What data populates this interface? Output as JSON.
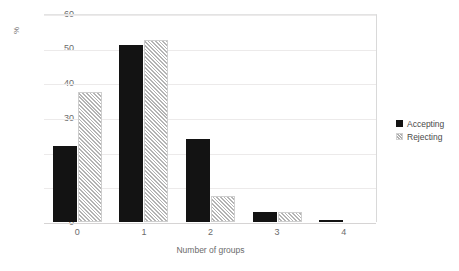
{
  "chart_data": {
    "type": "bar",
    "title": "",
    "xlabel": "Number of groups",
    "ylabel": "%",
    "categories": [
      "0",
      "1",
      "2",
      "3",
      "4"
    ],
    "series": [
      {
        "name": "Accepting",
        "pattern": "solid",
        "color": "#131313",
        "values": [
          22,
          51,
          24,
          3,
          0.5
        ]
      },
      {
        "name": "Rejecting",
        "pattern": "diagonal-hatch",
        "color": "#b4b4b4",
        "values": [
          37.5,
          52.5,
          7.5,
          3,
          0
        ]
      }
    ],
    "ylim": [
      0,
      60
    ],
    "yticks": [
      0,
      10,
      20,
      30,
      40,
      50,
      60
    ],
    "ytick_labels": [
      "0",
      "10",
      "20",
      "30",
      "40",
      "50",
      "60"
    ],
    "grid": "horizontal",
    "legend_position": "right"
  },
  "legend": {
    "entries": [
      {
        "label": "Accepting"
      },
      {
        "label": "Rejecting"
      }
    ]
  },
  "axes": {
    "y_title": "%",
    "x_title": "Number of groups"
  }
}
